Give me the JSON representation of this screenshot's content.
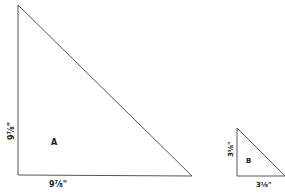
{
  "diagram": {
    "colors": {
      "stroke": "#555555",
      "text": "#1a1a1a",
      "background": "#ffffff"
    },
    "triangles": [
      {
        "id": "A",
        "label": "A",
        "height_label": "9⅞\"",
        "base_label": "9⅞\""
      },
      {
        "id": "B",
        "label": "B",
        "height_label": "3⅛\"",
        "base_label": "3⅛\""
      }
    ]
  }
}
